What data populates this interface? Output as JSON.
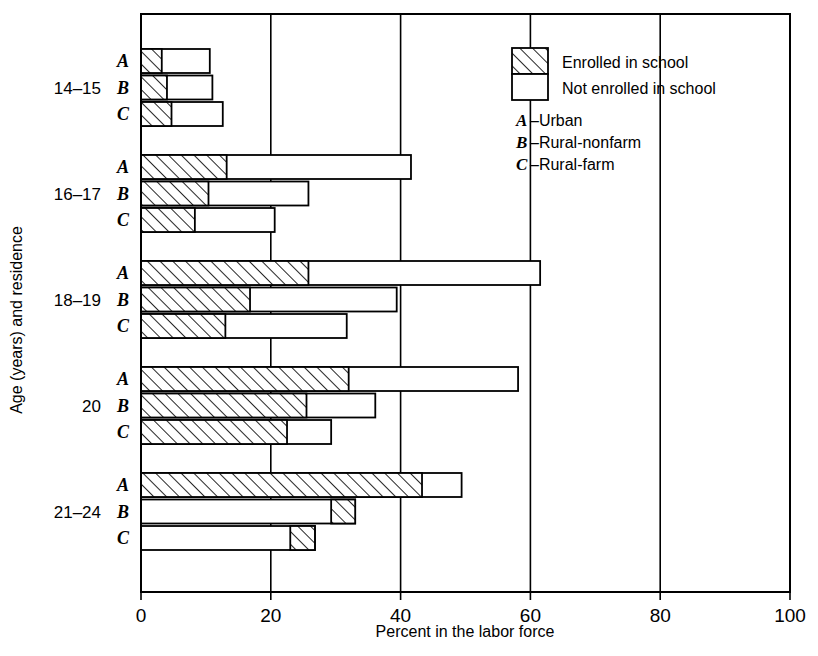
{
  "chart_data": {
    "type": "bar",
    "orientation": "horizontal",
    "title": "",
    "xlabel": "Percent in the labor force",
    "ylabel": "Age (years) and residence",
    "xlim": [
      0,
      100
    ],
    "xticks": [
      0,
      20,
      40,
      60,
      80,
      100
    ],
    "xtick_labels": [
      "0",
      "20",
      "40",
      "60",
      "80",
      "100"
    ],
    "grid": "vertical gridlines at each x tick",
    "legend_position": "top-right inside plot area",
    "stacked": true,
    "series": [
      {
        "name": "Enrolled in school",
        "fill": "diagonal-hatch"
      },
      {
        "name": "Not enrolled in school",
        "fill": "white"
      }
    ],
    "residence_keys": [
      {
        "letter": "A",
        "dash": "–",
        "label": "Urban"
      },
      {
        "letter": "B",
        "dash": "–",
        "label": "Rural-nonfarm"
      },
      {
        "letter": "C",
        "dash": "–",
        "label": "Rural-farm"
      }
    ],
    "groups": [
      {
        "label": "14–15",
        "rows": [
          {
            "residence": "A",
            "enrolled": 3.2,
            "not_enrolled": 7.4,
            "total": 10.6,
            "hatch_side": "left"
          },
          {
            "residence": "B",
            "enrolled": 4.0,
            "not_enrolled": 7.0,
            "total": 11.0,
            "hatch_side": "left"
          },
          {
            "residence": "C",
            "enrolled": 4.7,
            "not_enrolled": 7.9,
            "total": 12.6,
            "hatch_side": "left"
          }
        ]
      },
      {
        "label": "16–17",
        "rows": [
          {
            "residence": "A",
            "enrolled": 13.2,
            "not_enrolled": 28.4,
            "total": 41.6,
            "hatch_side": "left"
          },
          {
            "residence": "B",
            "enrolled": 10.4,
            "not_enrolled": 15.4,
            "total": 25.8,
            "hatch_side": "left"
          },
          {
            "residence": "C",
            "enrolled": 8.3,
            "not_enrolled": 12.3,
            "total": 20.6,
            "hatch_side": "left"
          }
        ]
      },
      {
        "label": "18–19",
        "rows": [
          {
            "residence": "A",
            "enrolled": 25.8,
            "not_enrolled": 35.7,
            "total": 61.5,
            "hatch_side": "left"
          },
          {
            "residence": "B",
            "enrolled": 16.8,
            "not_enrolled": 22.6,
            "total": 39.4,
            "hatch_side": "left"
          },
          {
            "residence": "C",
            "enrolled": 13.0,
            "not_enrolled": 18.7,
            "total": 31.7,
            "hatch_side": "left"
          }
        ]
      },
      {
        "label": "20",
        "rows": [
          {
            "residence": "A",
            "enrolled": 32.0,
            "not_enrolled": 26.1,
            "total": 58.1,
            "hatch_side": "left"
          },
          {
            "residence": "B",
            "enrolled": 25.5,
            "not_enrolled": 10.6,
            "total": 36.1,
            "hatch_side": "left"
          },
          {
            "residence": "C",
            "enrolled": 22.5,
            "not_enrolled": 6.8,
            "total": 29.3,
            "hatch_side": "left"
          }
        ]
      },
      {
        "label": "21–24",
        "rows": [
          {
            "residence": "A",
            "enrolled": 43.3,
            "not_enrolled": 6.1,
            "total": 49.4,
            "hatch_side": "left"
          },
          {
            "residence": "B",
            "enrolled": 3.7,
            "not_enrolled": 29.3,
            "total": 33.0,
            "hatch_side": "right"
          },
          {
            "residence": "C",
            "enrolled": 3.8,
            "not_enrolled": 23.0,
            "total": 26.8,
            "hatch_side": "right"
          }
        ]
      }
    ]
  }
}
